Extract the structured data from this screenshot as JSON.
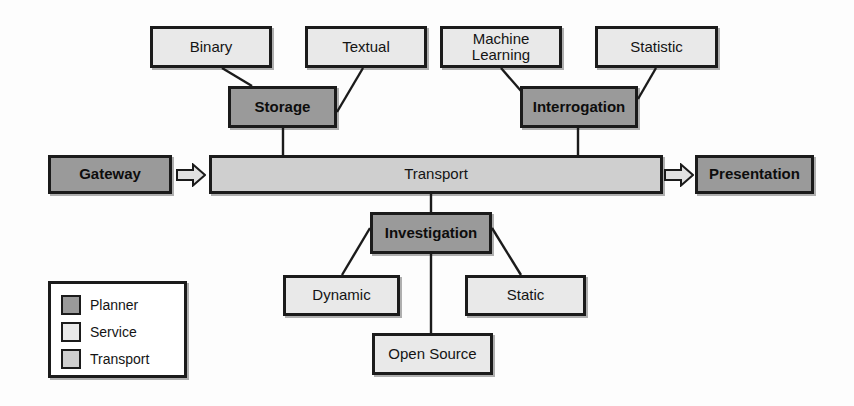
{
  "diagram": {
    "colors": {
      "planner_fill": "#9a9a9a",
      "service_fill": "#e9e9e9",
      "transport_fill": "#cfcfcf",
      "stroke": "#1b1b1b",
      "background": "#fdfdfd"
    },
    "nodes": [
      {
        "id": "binary",
        "label": "Binary",
        "kind": "service",
        "x": 150,
        "y": 26,
        "w": 122,
        "h": 42
      },
      {
        "id": "textual",
        "label": "Textual",
        "kind": "service",
        "x": 305,
        "y": 26,
        "w": 122,
        "h": 42
      },
      {
        "id": "machine",
        "label": "Machine Learning",
        "kind": "service",
        "x": 440,
        "y": 26,
        "w": 122,
        "h": 42
      },
      {
        "id": "statistic",
        "label": "Statistic",
        "kind": "service",
        "x": 595,
        "y": 26,
        "w": 123,
        "h": 42
      },
      {
        "id": "storage",
        "label": "Storage",
        "kind": "planner",
        "x": 228,
        "y": 86,
        "w": 109,
        "h": 42
      },
      {
        "id": "interrogation",
        "label": "Interrogation",
        "kind": "planner",
        "x": 520,
        "y": 86,
        "w": 118,
        "h": 42
      },
      {
        "id": "gateway",
        "label": "Gateway",
        "kind": "planner",
        "x": 48,
        "y": 155,
        "w": 124,
        "h": 39
      },
      {
        "id": "transport",
        "label": "Transport",
        "kind": "transport",
        "x": 209,
        "y": 155,
        "w": 454,
        "h": 39
      },
      {
        "id": "presentation",
        "label": "Presentation",
        "kind": "planner",
        "x": 695,
        "y": 155,
        "w": 119,
        "h": 39
      },
      {
        "id": "investigation",
        "label": "Investigation",
        "kind": "planner",
        "x": 370,
        "y": 212,
        "w": 122,
        "h": 42
      },
      {
        "id": "dynamic",
        "label": "Dynamic",
        "kind": "service",
        "x": 283,
        "y": 275,
        "w": 117,
        "h": 41
      },
      {
        "id": "static",
        "label": "Static",
        "kind": "service",
        "x": 465,
        "y": 275,
        "w": 121,
        "h": 41
      },
      {
        "id": "opensource",
        "label": "Open Source",
        "kind": "service",
        "x": 372,
        "y": 333,
        "w": 121,
        "h": 42
      }
    ],
    "edges": [
      {
        "from": "binary",
        "to": "storage",
        "x1": 222,
        "y1": 68,
        "x2": 252,
        "y2": 86
      },
      {
        "from": "textual",
        "to": "storage",
        "x1": 363,
        "y1": 68,
        "x2": 337,
        "y2": 112
      },
      {
        "from": "storage",
        "to": "transport",
        "x1": 283,
        "y1": 128,
        "x2": 283,
        "y2": 155
      },
      {
        "from": "machine",
        "to": "interrogation",
        "x1": 501,
        "y1": 68,
        "x2": 528,
        "y2": 99
      },
      {
        "from": "statistic",
        "to": "interrogation",
        "x1": 656,
        "y1": 68,
        "x2": 638,
        "y2": 99
      },
      {
        "from": "interrogation",
        "to": "transport",
        "x1": 578,
        "y1": 128,
        "x2": 578,
        "y2": 155
      },
      {
        "from": "transport",
        "to": "investigation",
        "x1": 431,
        "y1": 194,
        "x2": 431,
        "y2": 212
      },
      {
        "from": "investigation",
        "to": "dynamic",
        "x1": 370,
        "y1": 228,
        "x2": 342,
        "y2": 275
      },
      {
        "from": "investigation",
        "to": "static",
        "x1": 492,
        "y1": 228,
        "x2": 521,
        "y2": 275
      },
      {
        "from": "investigation",
        "to": "opensource",
        "x1": 431,
        "y1": 254,
        "x2": 431,
        "y2": 333
      }
    ],
    "arrows": [
      {
        "id": "gateway-to-transport",
        "label": "flow-arrow-right",
        "x": 176,
        "y": 163,
        "w": 30,
        "h": 24
      },
      {
        "id": "transport-to-presentation",
        "label": "flow-arrow-right",
        "x": 664,
        "y": 163,
        "w": 30,
        "h": 24
      }
    ]
  },
  "legend": {
    "items": [
      {
        "label": "Planner",
        "swatch": "#9a9a9a"
      },
      {
        "label": "Service",
        "swatch": "#e9e9e9"
      },
      {
        "label": "Transport",
        "swatch": "#cfcfcf"
      }
    ]
  }
}
